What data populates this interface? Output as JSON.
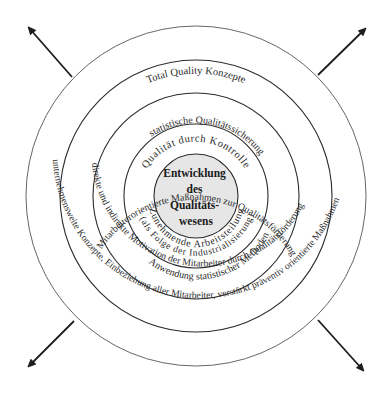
{
  "diagram": {
    "center": {
      "lines": [
        "Entwicklung",
        "des",
        "Qualitäts-",
        "wesens"
      ],
      "fill": "#e6e6e6"
    },
    "rings": [
      {
        "level": 1,
        "top": "Qualität durch Kontrolle",
        "bottom": [
          "Zunehmende Arbeitsteilung",
          "(als Folge der Industrialisierung)"
        ]
      },
      {
        "level": 2,
        "top": "statistische Qualitätssicherung",
        "bottom": [
          "Anwendung statistischer Methoden"
        ]
      },
      {
        "level": 3,
        "top": "Mitarbeiterorientierte Maßnahmen zur Qualitätsförderung",
        "bottom": [
          "direkte und indirekte Motivation der Mitarbeiter durch Qualitätsförderung"
        ]
      },
      {
        "level": 4,
        "top": "Total Quality Konzepte",
        "bottom": [
          "unternehmensweite Konzepte, Einbeziehung aller Mitarbeiter, verstärkt präventiv orientierte Maßnahmen"
        ]
      }
    ],
    "arrows": [
      "up-left",
      "up-right",
      "down-left",
      "down-right"
    ],
    "colors": {
      "line": "#2b2b2b",
      "text": "#2a2a2a",
      "center_fill": "#e6e6e6"
    }
  }
}
